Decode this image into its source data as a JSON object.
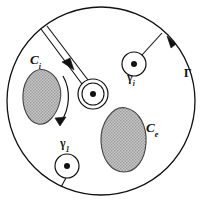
{
  "figure": {
    "background_color": "#ffffff",
    "stroke_color": "#111111",
    "blob_fill_color": "#b3b3b3",
    "blob_stroke_color": "#333333"
  },
  "labels": {
    "outer_contour": {
      "base": "Γ",
      "sub": ""
    },
    "blob_interior": {
      "base": "C",
      "sub": "i"
    },
    "blob_exterior": {
      "base": "C",
      "sub": "e"
    },
    "pole_upper_right": {
      "base": "γ",
      "sub": "i"
    },
    "pole_lower_left": {
      "base": "γ",
      "sub": "1"
    }
  },
  "elements": {
    "outer_circle": {
      "name": "outer-boundary-circle",
      "cx": 101,
      "cy": 101,
      "r": 94,
      "direction": "counterclockwise"
    },
    "direction_arrow": {
      "name": "outer-contour-direction-arrow",
      "x": 170,
      "y": 42,
      "heading": "counterclockwise"
    },
    "blobs": [
      {
        "name": "blob-interior",
        "label_key": "blob_interior",
        "cx": 42,
        "cy": 97,
        "rx": 19,
        "ry": 26,
        "rotation": -18,
        "arrow": "clockwise-outer-arc"
      },
      {
        "name": "blob-exterior",
        "label_key": "blob_exterior",
        "cx": 124,
        "cy": 140,
        "rx": 22,
        "ry": 31,
        "rotation": 10,
        "arrow": "none"
      }
    ],
    "small_circles": [
      {
        "name": "keyhole-pole-circle",
        "cx": 93,
        "cy": 94,
        "r": 15,
        "inner_r": 11,
        "dot_r": 3,
        "has_branch_cut": true
      },
      {
        "name": "pole-circle-gamma-i",
        "cx": 134,
        "cy": 64,
        "r": 12,
        "dot_r": 3,
        "has_branch_cut": false
      },
      {
        "name": "pole-circle-gamma-1",
        "cx": 67,
        "cy": 166,
        "r": 12,
        "dot_r": 3,
        "has_branch_cut": false
      }
    ],
    "connector_lines": [
      {
        "name": "connector-gamma-i-to-boundary",
        "x1": 142,
        "y1": 55,
        "x2": 160,
        "y2": 35
      },
      {
        "name": "connector-gamma-1-to-boundary",
        "x1": 67,
        "y1": 178,
        "x2": 62,
        "y2": 186
      },
      {
        "name": "branch-cut-line-upper",
        "x1": 82,
        "y1": 85,
        "x2": 43,
        "y2": 31
      },
      {
        "name": "branch-cut-line-lower",
        "x1": 87,
        "y1": 81,
        "x2": 48,
        "y2": 29
      }
    ],
    "branch_cut_arrow": {
      "name": "branch-cut-direction-arrow",
      "x": 68,
      "y": 68,
      "heading": "up-left"
    }
  },
  "label_positions": {
    "blob_interior": {
      "left": 30,
      "top": 54
    },
    "blob_exterior": {
      "left": 146,
      "top": 122
    },
    "pole_upper_right": {
      "left": 126,
      "top": 70
    },
    "pole_lower_left": {
      "left": 61,
      "top": 137
    },
    "outer_contour": {
      "left": 183,
      "top": 68
    }
  }
}
